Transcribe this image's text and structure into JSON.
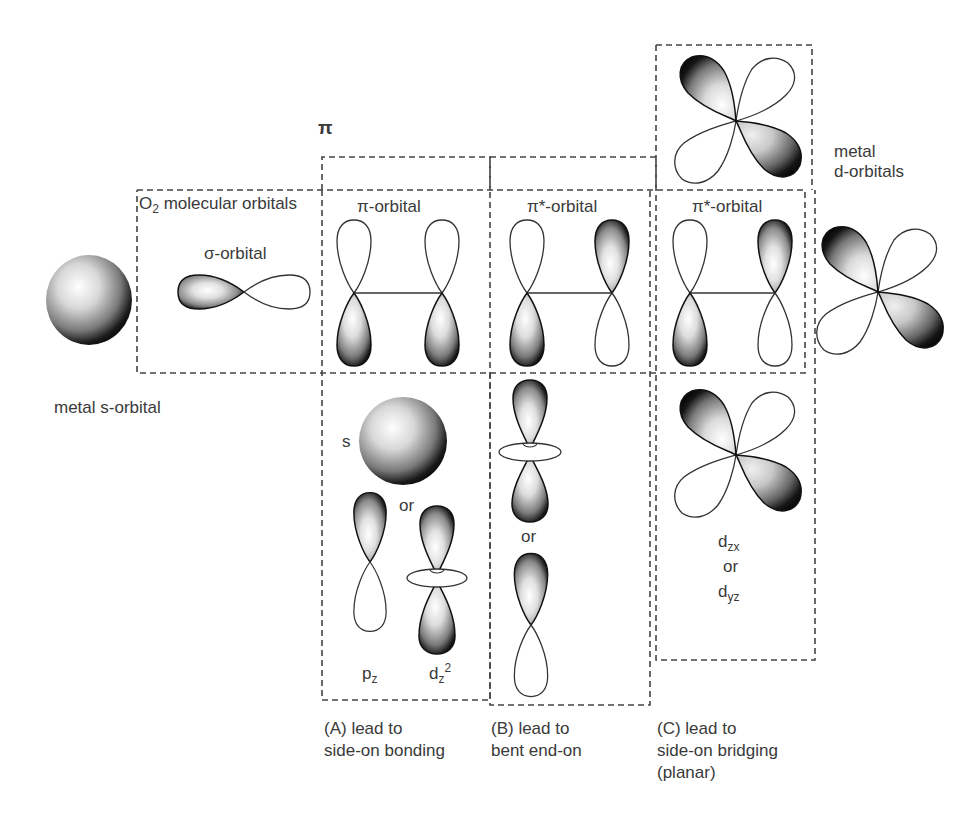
{
  "figure": {
    "type": "orbital-interaction-diagram",
    "colors": {
      "background": "#ffffff",
      "outline": "#333333",
      "dashed_box": "#444444",
      "shading_dark": "#111111",
      "shading_light": "#ffffff",
      "text": "#3a3a3a"
    }
  },
  "labels": {
    "pi_top": "π",
    "o2_molecular_orbitals": "molecular orbitals",
    "o2_prefix": "O",
    "o2_sub": "2",
    "sigma_orbital": "σ-orbital",
    "pi_orbital": "π-orbital",
    "pi_star_orbital_b": "π*-orbital",
    "pi_star_orbital_c": "π*-orbital",
    "metal_s_orbital": "metal s-orbital",
    "metal_d_orbitals_line1": "metal",
    "metal_d_orbitals_line2": "d-orbitals",
    "s": "s",
    "or_a": "or",
    "or_b": "or",
    "pz_base": "p",
    "pz_sub": "z",
    "dz2_base": "d",
    "dz2_sub": "z",
    "dz2_sup": "2",
    "dzx_base": "d",
    "dzx_sub": "zx",
    "or_c": "or",
    "dyz_base": "d",
    "dyz_sub": "yz"
  },
  "captions": [
    {
      "id": "A",
      "line1": "(A) lead to",
      "line2": "side-on bonding",
      "line3": ""
    },
    {
      "id": "B",
      "line1": "(B) lead to",
      "line2": "bent end-on",
      "line3": ""
    },
    {
      "id": "C",
      "line1": "(C) lead to",
      "line2": "side-on bridging",
      "line3": "(planar)"
    }
  ],
  "orbitals": [
    {
      "name": "metal-s-orbital",
      "shape": "sphere"
    },
    {
      "name": "o2-sigma-orbital",
      "shape": "two-lobe-horizontal"
    },
    {
      "name": "o2-pi-orbital",
      "shape": "two p-orbitals in phase, linked"
    },
    {
      "name": "o2-pi-star-orbital-b",
      "shape": "two p-orbitals out of phase, linked"
    },
    {
      "name": "o2-pi-star-orbital-c",
      "shape": "two p-orbitals out of phase, linked"
    },
    {
      "name": "metal-s-option-a",
      "shape": "sphere"
    },
    {
      "name": "metal-pz-option-a",
      "shape": "p-orbital"
    },
    {
      "name": "metal-dz2-option-a",
      "shape": "dz2"
    },
    {
      "name": "metal-dz2-option-b",
      "shape": "dz2"
    },
    {
      "name": "metal-pz-option-b",
      "shape": "p-orbital"
    },
    {
      "name": "metal-d-orbital-top-c",
      "shape": "cloverleaf"
    },
    {
      "name": "metal-d-orbital-bottom-c",
      "shape": "cloverleaf"
    },
    {
      "name": "metal-d-orbital-right",
      "shape": "cloverleaf"
    }
  ]
}
